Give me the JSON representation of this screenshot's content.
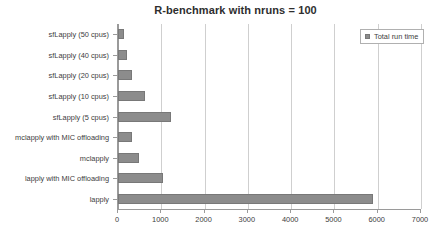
{
  "chart_data": {
    "type": "bar",
    "orientation": "horizontal",
    "title": "R-benchmark with nruns = 100",
    "xlabel": "",
    "ylabel": "",
    "xlim": [
      0,
      7000
    ],
    "xticks": [
      0,
      1000,
      2000,
      3000,
      4000,
      5000,
      6000,
      7000
    ],
    "xtick_labels": [
      "0",
      "1000",
      "2000",
      "3000",
      "4000",
      "5000",
      "6000",
      "7000"
    ],
    "grid": "vertical",
    "legend_position": "top-right",
    "legend": [
      "Total run time"
    ],
    "categories": [
      "sfLapply (50 cpus)",
      "sfLapply (40 cpus)",
      "sfLapply (20 cpus)",
      "sfLapply (10 cpus)",
      "sfLapply (5 cpus)",
      "mclapply with MIC offloading",
      "mclapply",
      "lapply with MIC offloading",
      "lapply"
    ],
    "series": [
      {
        "name": "Total run time",
        "color": "#8c8c8c",
        "values": [
          140,
          210,
          320,
          620,
          1230,
          330,
          480,
          1050,
          5900
        ]
      }
    ]
  },
  "colors": {
    "bar_fill": "#8c8c8c",
    "bar_stroke": "#787878",
    "gridline": "#cfcfcf",
    "axis": "#9a9a9a",
    "text": "#3d3d3d",
    "background": "#ffffff"
  }
}
